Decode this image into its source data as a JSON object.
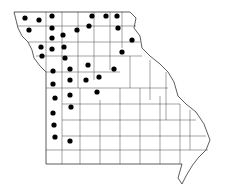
{
  "map": {
    "subject": "Missouri county distribution map",
    "outline_color": "#333333",
    "dot_color": "#000000",
    "background": "#ffffff",
    "dots": [
      [
        25,
        18
      ],
      [
        39,
        20
      ],
      [
        52,
        16
      ],
      [
        92,
        16
      ],
      [
        106,
        16
      ],
      [
        117,
        16
      ],
      [
        29,
        30
      ],
      [
        52,
        28
      ],
      [
        77,
        30
      ],
      [
        89,
        26
      ],
      [
        118,
        28
      ],
      [
        52,
        38
      ],
      [
        63,
        35
      ],
      [
        132,
        40
      ],
      [
        41,
        47
      ],
      [
        52,
        49
      ],
      [
        64,
        47
      ],
      [
        122,
        52
      ],
      [
        42,
        56
      ],
      [
        65,
        58
      ],
      [
        53,
        71
      ],
      [
        70,
        69
      ],
      [
        88,
        65
      ],
      [
        114,
        69
      ],
      [
        70,
        80
      ],
      [
        86,
        80
      ],
      [
        99,
        77
      ],
      [
        53,
        84
      ],
      [
        55,
        98
      ],
      [
        70,
        95
      ],
      [
        97,
        92
      ],
      [
        71,
        107
      ],
      [
        53,
        113
      ],
      [
        54,
        125
      ],
      [
        55,
        137
      ],
      [
        70,
        141
      ]
    ]
  }
}
